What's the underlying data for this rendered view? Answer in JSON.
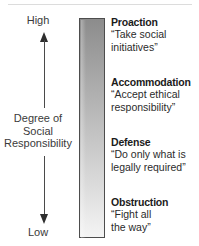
{
  "figure": {
    "axis": {
      "top_label": "High",
      "bottom_label": "Low",
      "caption_lines": [
        "Degree of",
        "Social",
        "Responsibility"
      ],
      "up_arrow_icon": "arrow-up-icon",
      "down_arrow_icon": "arrow-down-icon"
    },
    "gradient_bar": {
      "top_color": "#8c8c8c",
      "bottom_color": "#f4f4f4",
      "border_color": "#4d4d4d"
    },
    "stances": [
      {
        "title": "Proaction",
        "quote_lines": [
          "“Take social",
          "initiatives”"
        ]
      },
      {
        "title": "Accommodation",
        "quote_lines": [
          "“Accept ethical",
          "responsibility”"
        ]
      },
      {
        "title": "Defense",
        "quote_lines": [
          "“Do only what is",
          "legally required”"
        ]
      },
      {
        "title": "Obstruction",
        "quote_lines": [
          "“Fight all",
          "the way”"
        ]
      }
    ]
  },
  "chart_data": {
    "type": "bar",
    "title": "Degree of Social Responsibility",
    "xlabel": "",
    "ylabel": "Degree of Social Responsibility",
    "orientation": "vertical",
    "grid": false,
    "legend": "none",
    "axis_ticks": [
      "Low",
      "High"
    ],
    "categories": [
      "Obstruction",
      "Defense",
      "Accommodation",
      "Proaction"
    ],
    "values": [
      1,
      2,
      3,
      4
    ],
    "ylim": [
      0,
      4
    ],
    "annotations": [
      "Proaction — “Take social initiatives”",
      "Accommodation — “Accept ethical responsibility”",
      "Defense — “Do only what is legally required”",
      "Obstruction — “Fight all the way”"
    ]
  }
}
